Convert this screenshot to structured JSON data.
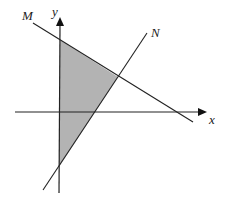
{
  "diagram": {
    "labels": {
      "x_axis": "x",
      "y_axis": "y",
      "line_m": "M",
      "line_n": "N"
    },
    "colors": {
      "line": "#222222",
      "shade": "#b3b3b3",
      "background": "#ffffff"
    },
    "shaded_region": "triangle bounded by y-axis, line M and line N"
  }
}
